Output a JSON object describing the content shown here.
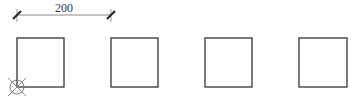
{
  "dimension": {
    "label": "200",
    "x1": 17,
    "x2": 111,
    "y": 15
  },
  "squares": [
    {
      "id": "square-1",
      "x": 17,
      "y": 38,
      "w": 47,
      "h": 49
    },
    {
      "id": "square-2",
      "x": 111,
      "y": 38,
      "w": 47,
      "h": 49
    },
    {
      "id": "square-3",
      "x": 205,
      "y": 38,
      "w": 47,
      "h": 49
    },
    {
      "id": "square-4",
      "x": 299,
      "y": 38,
      "w": 48,
      "h": 49
    }
  ],
  "origin_marker": {
    "cx": 17,
    "cy": 87,
    "r": 7
  },
  "colors": {
    "stroke": "#333333",
    "light": "#999999"
  }
}
